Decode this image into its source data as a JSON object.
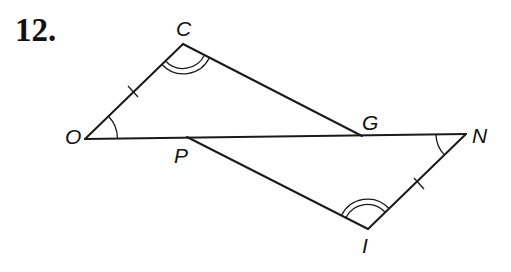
{
  "problem": {
    "number": "12."
  },
  "figure": {
    "vertices": {
      "C": {
        "label": "C",
        "x": 183,
        "y": 44
      },
      "O": {
        "label": "O",
        "x": 85,
        "y": 139
      },
      "G": {
        "label": "G",
        "x": 362,
        "y": 136
      },
      "N": {
        "label": "N",
        "x": 466,
        "y": 134
      },
      "P": {
        "label": "P",
        "x": 187,
        "y": 137
      },
      "I": {
        "label": "I",
        "x": 368,
        "y": 229
      }
    },
    "segments": [
      "OC",
      "CG",
      "ON",
      "PI",
      "IN"
    ],
    "congruent_sides": [
      "OC",
      "IN"
    ],
    "single_arc_angles": [
      "O",
      "N"
    ],
    "double_arc_angles": [
      "C",
      "I"
    ],
    "line_color": "#1a1a1a"
  }
}
